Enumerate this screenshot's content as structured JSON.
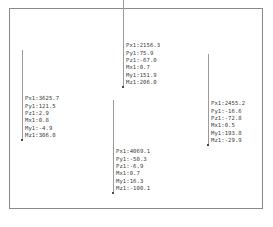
{
  "viewport": {
    "background_color": "#ffffff",
    "frame_color": "#8a8a8a",
    "leader_color": "#9a9a9a",
    "anchor_color": "#4a4a4a",
    "text_color": "#3b3b3b"
  },
  "callouts": [
    {
      "id": "callout-left",
      "x": 22,
      "y": 95,
      "leader_height": 45,
      "rows": [
        "Px1:3625.7",
        "Py1:121.5",
        "Pz1:2.9",
        "Mx1:0.8",
        "My1:-4.9",
        "Mz1:306.0"
      ]
    },
    {
      "id": "callout-top-center",
      "x": 123,
      "y": 42,
      "leader_height": 50,
      "rows": [
        "Px1:2156.3",
        "Py1:75.9",
        "Pz1:-67.0",
        "Mx1:0.7",
        "My1:151.9",
        "Mz1:206.0"
      ]
    },
    {
      "id": "callout-bottom-center",
      "x": 113,
      "y": 148,
      "leader_height": 48,
      "rows": [
        "Px1:4069.1",
        "Py1:-50.3",
        "Pz1:-6.9",
        "Mx1:0.7",
        "My1:16.3",
        "Mz1:-100.1"
      ]
    },
    {
      "id": "callout-right",
      "x": 208,
      "y": 100,
      "leader_height": 46,
      "rows": [
        "Px1:2455.2",
        "Py1:-16.6",
        "Pz1:-72.8",
        "Mx1:0.5",
        "My1:193.8",
        "Mz1:-29.9"
      ]
    }
  ]
}
